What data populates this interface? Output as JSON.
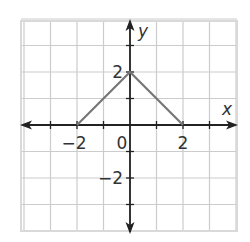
{
  "chart_data": {
    "type": "line",
    "title": "",
    "xlabel": "x",
    "ylabel": "y",
    "xlim": [
      -4,
      4
    ],
    "ylim": [
      -4,
      4
    ],
    "grid": true,
    "grid_step": 1,
    "x_tick_labels": [
      {
        "value": -2,
        "text": "−2"
      },
      {
        "value": 0,
        "text": "0"
      },
      {
        "value": 2,
        "text": "2"
      }
    ],
    "y_tick_labels": [
      {
        "value": 2,
        "text": "2"
      },
      {
        "value": -2,
        "text": "−2"
      }
    ],
    "series": [
      {
        "name": "graph",
        "points": [
          [
            -2,
            0
          ],
          [
            0,
            2
          ],
          [
            2,
            0
          ]
        ],
        "color": "#777777"
      }
    ]
  },
  "style": {
    "axis_color": "#222222",
    "grid_color": "#cccccc",
    "border_color": "#d9d9d9",
    "line_color": "#777777"
  }
}
